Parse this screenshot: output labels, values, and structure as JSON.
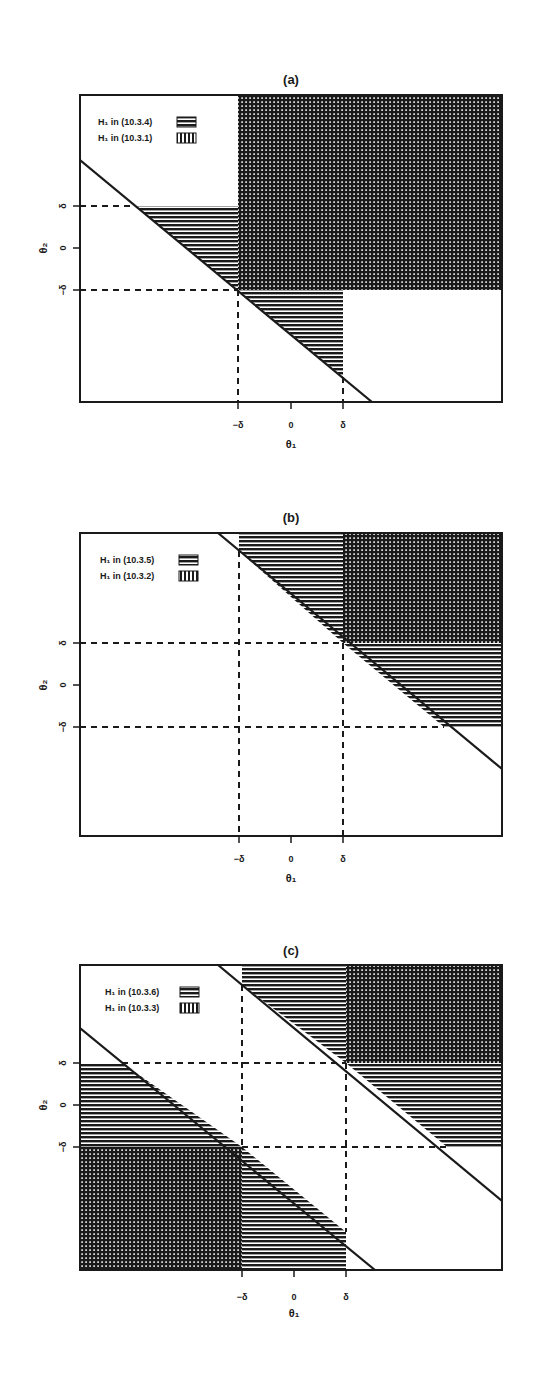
{
  "figure": {
    "panels": [
      {
        "title": "(a)",
        "legend": [
          {
            "label": "H₁ in (10.3.4)",
            "pattern": "horizontal-lines"
          },
          {
            "label": "H₁ in (10.3.1)",
            "pattern": "vertical-lines"
          }
        ],
        "xlabel": "θ₁",
        "ylabel": "θ₂",
        "xticks": [
          "−δ",
          "0",
          "δ"
        ],
        "yticks": [
          "δ",
          "0",
          "−δ"
        ]
      },
      {
        "title": "(b)",
        "legend": [
          {
            "label": "H₁ in (10.3.5)",
            "pattern": "horizontal-lines"
          },
          {
            "label": "H₁ in (10.3.2)",
            "pattern": "vertical-lines"
          }
        ],
        "xlabel": "θ₁",
        "ylabel": "θ₂",
        "xticks": [
          "−δ",
          "0",
          "δ"
        ],
        "yticks": [
          "δ",
          "0",
          "−δ"
        ]
      },
      {
        "title": "(c)",
        "legend": [
          {
            "label": "H₁ in (10.3.6)",
            "pattern": "horizontal-lines"
          },
          {
            "label": "H₁ in (10.3.3)",
            "pattern": "vertical-lines"
          }
        ],
        "xlabel": "θ₁",
        "ylabel": "θ₂",
        "xticks": [
          "−δ",
          "0",
          "δ"
        ],
        "yticks": [
          "δ",
          "0",
          "−δ"
        ]
      }
    ],
    "colors": {
      "ink": "#1a1a1a",
      "background": "#ffffff"
    }
  }
}
